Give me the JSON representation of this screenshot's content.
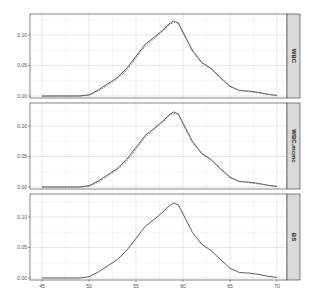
{
  "chart_data": {
    "type": "line",
    "title": "",
    "xlabel": "",
    "ylabel": "",
    "xlim": [
      44,
      71
    ],
    "ylim": [
      0,
      0.13
    ],
    "x_ticks": [
      45,
      50,
      55,
      60,
      65,
      70
    ],
    "x_tick_labels": [
      "45",
      "50",
      "55",
      "60",
      "65",
      "70"
    ],
    "y_ticks": [
      0.0,
      0.05,
      0.1
    ],
    "y_tick_labels": [
      "0.00",
      "0.05",
      "0.10"
    ],
    "grid": true,
    "legend": "none",
    "facets": [
      {
        "label": "WBC",
        "series": [
          {
            "name": "estimate",
            "style": "solid",
            "x": [
              45,
              47,
              49,
              50,
              51,
              52,
              53,
              54,
              55,
              56,
              57,
              58,
              58.5,
              59,
              59.5,
              60,
              61,
              62,
              63,
              64,
              65,
              66,
              67,
              68,
              69,
              70
            ],
            "y": [
              0.0,
              0.0,
              0.0,
              0.002,
              0.01,
              0.02,
              0.03,
              0.045,
              0.065,
              0.085,
              0.097,
              0.11,
              0.118,
              0.123,
              0.12,
              0.105,
              0.075,
              0.055,
              0.045,
              0.03,
              0.016,
              0.009,
              0.008,
              0.006,
              0.003,
              0.001
            ]
          },
          {
            "name": "reference",
            "style": "dashed",
            "x": [
              45,
              47,
              49,
              50,
              51,
              52,
              53,
              54,
              55,
              56,
              57,
              58,
              58.5,
              59,
              59.5,
              60,
              61,
              62,
              63,
              64,
              65,
              66,
              67,
              68,
              69,
              70
            ],
            "y": [
              0.0,
              0.0,
              0.0,
              0.001,
              0.008,
              0.018,
              0.028,
              0.042,
              0.062,
              0.082,
              0.095,
              0.108,
              0.116,
              0.121,
              0.119,
              0.103,
              0.073,
              0.054,
              0.044,
              0.029,
              0.015,
              0.009,
              0.007,
              0.005,
              0.003,
              0.001
            ]
          }
        ]
      },
      {
        "label": "WBC.mcmc",
        "series": [
          {
            "name": "estimate",
            "style": "solid",
            "x": [
              45,
              47,
              49,
              50,
              51,
              52,
              53,
              54,
              55,
              56,
              57,
              58,
              58.5,
              59,
              59.5,
              60,
              61,
              62,
              63,
              64,
              65,
              66,
              67,
              68,
              69,
              70
            ],
            "y": [
              0.0,
              0.0,
              0.0,
              0.002,
              0.01,
              0.02,
              0.03,
              0.045,
              0.065,
              0.085,
              0.097,
              0.11,
              0.118,
              0.123,
              0.12,
              0.105,
              0.075,
              0.055,
              0.045,
              0.03,
              0.016,
              0.009,
              0.008,
              0.006,
              0.003,
              0.001
            ]
          },
          {
            "name": "reference",
            "style": "dashed",
            "x": [
              45,
              47,
              49,
              50,
              51,
              52,
              53,
              54,
              55,
              56,
              57,
              58,
              58.5,
              59,
              59.5,
              60,
              61,
              62,
              63,
              64,
              65,
              66,
              67,
              68,
              69,
              70
            ],
            "y": [
              0.0,
              0.0,
              0.0,
              0.001,
              0.008,
              0.018,
              0.028,
              0.042,
              0.062,
              0.082,
              0.095,
              0.108,
              0.116,
              0.121,
              0.119,
              0.103,
              0.073,
              0.054,
              0.044,
              0.029,
              0.015,
              0.009,
              0.007,
              0.005,
              0.003,
              0.001
            ]
          }
        ]
      },
      {
        "label": "BS",
        "series": [
          {
            "name": "estimate",
            "style": "solid",
            "x": [
              45,
              47,
              49,
              50,
              51,
              52,
              53,
              54,
              55,
              56,
              57,
              58,
              58.5,
              59,
              59.5,
              60,
              61,
              62,
              63,
              64,
              65,
              66,
              67,
              68,
              69,
              70
            ],
            "y": [
              0.0,
              0.0,
              0.0,
              0.002,
              0.01,
              0.02,
              0.03,
              0.045,
              0.065,
              0.085,
              0.097,
              0.11,
              0.118,
              0.123,
              0.12,
              0.105,
              0.075,
              0.055,
              0.045,
              0.03,
              0.016,
              0.009,
              0.008,
              0.006,
              0.003,
              0.001
            ]
          }
        ]
      }
    ]
  },
  "colors": {
    "panel_bg": "#ffffff",
    "grid_major": "#d9d9d9",
    "grid_minor": "#ebebeb",
    "panel_border": "#333333",
    "strip_bg": "#d9d9d9",
    "strip_border": "#333333",
    "line": "#333333",
    "dashed_line": "#777777",
    "tick_text": "#4d4d4d"
  }
}
